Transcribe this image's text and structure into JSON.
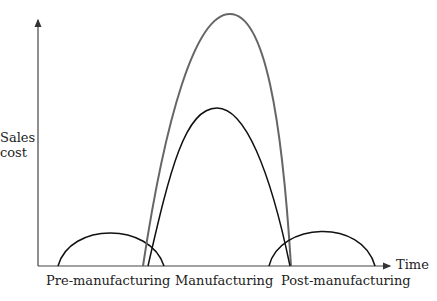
{
  "diagram": {
    "y_axis_label_line1": "Sales",
    "y_axis_label_line2": "cost",
    "x_axis_label": "Time",
    "phases": [
      "Pre-manufacturing",
      "Manufacturing",
      "Post-manufacturing"
    ],
    "colors": {
      "outer_curve": "#666666",
      "curves": "#111111",
      "axes": "#333333"
    },
    "curves": [
      {
        "name": "pre-manufacturing-curve",
        "start_x": 58,
        "peak": [
          110,
          230
        ],
        "end_x": 164
      },
      {
        "name": "manufacturing-outer-curve",
        "start_x": 143,
        "peak": [
          230,
          14
        ],
        "end_x": 291
      },
      {
        "name": "manufacturing-inner-curve",
        "start_x": 148,
        "peak": [
          217,
          108
        ],
        "end_x": 290
      },
      {
        "name": "post-manufacturing-curve",
        "start_x": 269,
        "peak": [
          322,
          229
        ],
        "end_x": 375
      }
    ]
  }
}
